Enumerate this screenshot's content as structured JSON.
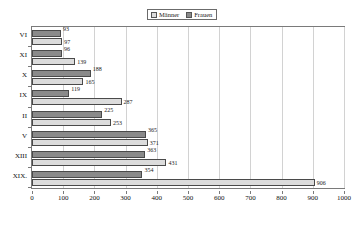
{
  "chart_data": {
    "type": "bar",
    "orientation": "horizontal",
    "title": "",
    "xlabel": "",
    "ylabel": "",
    "xlim": [
      0,
      1000
    ],
    "xticks": [
      0,
      100,
      200,
      300,
      400,
      500,
      600,
      700,
      800,
      900,
      1000
    ],
    "xtick_labels": [
      "0",
      "100",
      "200",
      "300",
      "400",
      "500",
      "600",
      "700",
      "800",
      "900",
      "1000"
    ],
    "categories": [
      "VI",
      "XI",
      "X",
      "IX",
      "II",
      "V",
      "XIII",
      "XIX."
    ],
    "grid": true,
    "legend_position": "top-center",
    "series": [
      {
        "name": "Männer",
        "color": "#dcdcdc",
        "values": [
          97,
          139,
          165,
          287,
          253,
          371,
          431,
          906
        ],
        "labels": [
          "97",
          "139",
          "165",
          "287",
          "253",
          "371",
          "431",
          "906"
        ]
      },
      {
        "name": "Frauen",
        "color": "#8a8a8a",
        "values": [
          93,
          96,
          188,
          119,
          225,
          365,
          363,
          354
        ],
        "labels": [
          "93",
          "96",
          "188",
          "119",
          "225",
          "365",
          "363",
          "354"
        ]
      }
    ]
  },
  "legend": {
    "entries": [
      {
        "label": "Männer"
      },
      {
        "label": "Frauen"
      }
    ]
  }
}
